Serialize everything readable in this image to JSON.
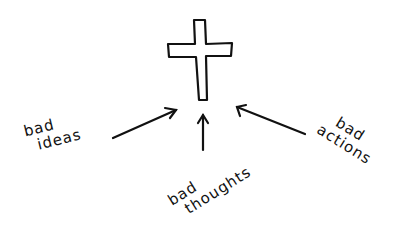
{
  "diagram": {
    "center": {
      "symbol": "cross-icon"
    },
    "labels": {
      "ideas": {
        "line1": "bad",
        "line2": "ideas"
      },
      "thoughts": {
        "line1": "bad",
        "line2": "thoughts"
      },
      "actions": {
        "line1": "bad",
        "line2": "actions"
      }
    },
    "colors": {
      "ink": "#111111",
      "background": "#ffffff"
    }
  }
}
